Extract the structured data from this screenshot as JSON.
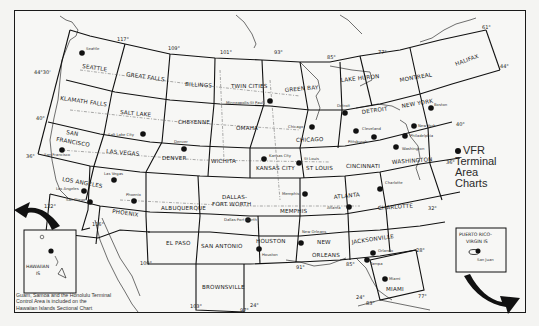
{
  "legend": {
    "marker": "dot",
    "lines": [
      "VFR",
      "Terminal",
      "Area",
      "Charts"
    ]
  },
  "note": {
    "lines": [
      "Guam, Samoa and the Honolulu Terminal",
      "Control Area is included on the",
      "Hawaiian Islands Sectional Chart"
    ]
  },
  "insets": {
    "hawaii": {
      "label_line1": "HAWAIIAN",
      "label_line2": "IS"
    },
    "puerto_rico": {
      "label_line1": "PUERTO RICO-",
      "label_line2": "VIRGIN IS",
      "city": "San Juan"
    }
  },
  "sectional_charts": [
    "SEATTLE",
    "GREAT FALLS",
    "BILLINGS",
    "TWIN CITIES",
    "GREEN BAY",
    "LAKE HURON",
    "MONTREAL",
    "HALIFAX",
    "KLAMATH FALLS",
    "SALT LAKE",
    "CHEYENNE",
    "OMAHA",
    "CHICAGO",
    "DETROIT",
    "NEW YORK",
    "SAN FRANCISCO",
    "LAS VEGAS",
    "DENVER",
    "WICHITA",
    "KANSAS CITY",
    "ST LOUIS",
    "CINCINNATI",
    "WASHINGTON",
    "LOS ANGELES",
    "PHOENIX",
    "ALBUQUERQUE",
    "DALLAS-FORT WORTH",
    "MEMPHIS",
    "ATLANTA",
    "CHARLOTTE",
    "EL PASO",
    "SAN ANTONIO",
    "HOUSTON",
    "NEW ORLEANS",
    "JACKSONVILLE",
    "BROWNSVILLE",
    "MIAMI"
  ],
  "labels": {
    "seattle": "SEATTLE",
    "great_falls": "GREAT FALLS",
    "billings": "BILLINGS",
    "twin_cities": "TWIN CITIES",
    "green_bay": "GREEN BAY",
    "lake_huron": "LAKE HURON",
    "montreal": "MONTREAL",
    "halifax": "HALIFAX",
    "klamath_falls": "KLAMATH FALLS",
    "salt_lake": "SALT LAKE",
    "cheyenne": "CHEYENNE",
    "omaha": "OMAHA",
    "chicago": "CHICAGO",
    "detroit": "DETROIT",
    "new_york": "NEW YORK",
    "san_francisco_1": "SAN",
    "san_francisco_2": "FRANCISCO",
    "las_vegas": "LAS VEGAS",
    "denver": "DENVER",
    "wichita": "WICHITA",
    "kansas_city": "KANSAS CITY",
    "st_louis": "ST LOUIS",
    "cincinnati": "CINCINNATI",
    "washington": "WASHINGTON",
    "los_angeles": "LOS ANGELES",
    "phoenix": "PHOENIX",
    "albuquerque": "ALBUQUERQUE",
    "dallas_1": "DALLAS-",
    "dallas_2": "FORT WORTH",
    "memphis": "MEMPHIS",
    "atlanta": "ATLANTA",
    "charlotte": "CHARLOTTE",
    "el_paso": "EL PASO",
    "san_antonio": "SAN ANTONIO",
    "houston": "HOUSTON",
    "new_orleans_1": "NEW",
    "new_orleans_2": "ORLEANS",
    "jacksonville": "JACKSONVILLE",
    "brownsville": "BROWNSVILLE",
    "miami": "MIAMI"
  },
  "terminal_areas": {
    "seattle": "Seattle",
    "minneapolis": "Minneapolis-St Paul",
    "salt_lake": "Salt Lake City",
    "denver": "Denver",
    "san_francisco": "San Francisco",
    "las_vegas": "Las Vegas",
    "los_angeles": "Los Angeles",
    "san_diego": "San Diego",
    "phoenix": "Phoenix",
    "kansas_city": "Kansas City",
    "st_louis": "St Louis",
    "chicago": "Chicago",
    "detroit": "Detroit",
    "cleveland": "Cleveland",
    "pittsburgh": "Pittsburgh",
    "boston": "Boston",
    "new_york": "New York",
    "philadelphia": "Philadelphia",
    "washington": "Washington",
    "charlotte": "Charlotte",
    "memphis": "Memphis",
    "atlanta": "Atlanta",
    "dallas": "Dallas-Fort Worth",
    "houston": "Houston",
    "new_orleans": "New Orleans",
    "orlando": "Orlando",
    "tampa": "Tampa",
    "miami": "Miami"
  },
  "coordinates": {
    "lon_117": "117°",
    "lon_109": "109°",
    "lon_101": "101°",
    "lon_93": "93°",
    "lon_85": "85°",
    "lon_77": "77°",
    "lon_61": "61°",
    "lat_44_30": "44°30'",
    "lat_40": "40°",
    "lat_36": "36°",
    "lat_40_e": "40°",
    "lat_36_e": "36°",
    "lat_32": "32°",
    "lat_28": "28°",
    "lat_24": "24°",
    "lat_24_b": "24°",
    "lat_44_e": "44°",
    "lon_122": "122°",
    "lon_116": "116°",
    "lon_109_b": "109°",
    "lon_103": "103°",
    "lon_97": "97°",
    "lon_91": "91°",
    "lon_85_b": "85°",
    "lon_83": "83°",
    "lon_77_b": "77°"
  }
}
